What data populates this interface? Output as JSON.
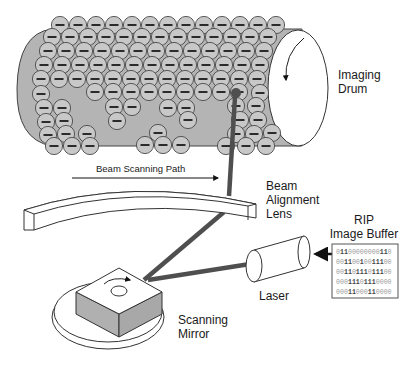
{
  "diagram": {
    "type": "laser-printer-imaging-process",
    "colors": {
      "drum_fill": "#b4b4b4",
      "toner_fill": "#c8c8c8",
      "toner_stroke": "#4a4a4a",
      "beam": "#4f4f4f",
      "outline": "#333333",
      "mirror_side": "#b0b0b0",
      "background": "#ffffff"
    },
    "labels": {
      "imaging_drum": [
        "Imaging",
        "Drum"
      ],
      "beam_scanning_path": "Beam Scanning Path",
      "beam_alignment_lens": [
        "Beam",
        "Alignment",
        "Lens"
      ],
      "rip_image_buffer": [
        "RIP",
        "Image Buffer"
      ],
      "laser": "Laser",
      "scanning_mirror": [
        "Scanning",
        "Mirror"
      ]
    },
    "toner_charge_symbol": "−",
    "rip_buffer_rows": [
      "01100000000110",
      "00110010011100",
      "00110111011100",
      "00011101110000",
      "00011000110000"
    ],
    "toner_particles": [
      [
        60,
        25
      ],
      [
        78,
        25
      ],
      [
        96,
        25
      ],
      [
        114,
        25
      ],
      [
        132,
        25
      ],
      [
        150,
        25
      ],
      [
        168,
        25
      ],
      [
        186,
        25
      ],
      [
        204,
        25
      ],
      [
        222,
        25
      ],
      [
        240,
        25
      ],
      [
        258,
        25
      ],
      [
        276,
        25
      ],
      [
        52,
        37
      ],
      [
        70,
        37
      ],
      [
        88,
        37
      ],
      [
        106,
        37
      ],
      [
        124,
        37
      ],
      [
        142,
        37
      ],
      [
        160,
        37
      ],
      [
        178,
        37
      ],
      [
        196,
        37
      ],
      [
        214,
        37
      ],
      [
        232,
        37
      ],
      [
        250,
        37
      ],
      [
        268,
        37
      ],
      [
        48,
        51
      ],
      [
        66,
        51
      ],
      [
        84,
        51
      ],
      [
        102,
        51
      ],
      [
        120,
        51
      ],
      [
        138,
        51
      ],
      [
        156,
        51
      ],
      [
        174,
        51
      ],
      [
        192,
        51
      ],
      [
        210,
        51
      ],
      [
        228,
        51
      ],
      [
        246,
        51
      ],
      [
        264,
        51
      ],
      [
        44,
        65
      ],
      [
        62,
        65
      ],
      [
        80,
        65
      ],
      [
        98,
        65
      ],
      [
        116,
        65
      ],
      [
        134,
        65
      ],
      [
        152,
        65
      ],
      [
        170,
        65
      ],
      [
        188,
        65
      ],
      [
        206,
        65
      ],
      [
        224,
        65
      ],
      [
        242,
        65
      ],
      [
        260,
        65
      ],
      [
        41,
        79
      ],
      [
        59,
        79
      ],
      [
        77,
        79
      ],
      [
        95,
        79
      ],
      [
        113,
        79
      ],
      [
        131,
        79
      ],
      [
        149,
        79
      ],
      [
        167,
        79
      ],
      [
        185,
        79
      ],
      [
        203,
        79
      ],
      [
        221,
        79
      ],
      [
        239,
        79
      ],
      [
        257,
        79
      ],
      [
        41,
        94
      ],
      [
        95,
        92
      ],
      [
        113,
        92
      ],
      [
        131,
        92
      ],
      [
        149,
        92
      ],
      [
        167,
        92
      ],
      [
        185,
        92
      ],
      [
        203,
        92
      ],
      [
        221,
        92
      ],
      [
        239,
        92
      ],
      [
        260,
        93
      ],
      [
        44,
        108
      ],
      [
        62,
        108
      ],
      [
        114,
        107
      ],
      [
        132,
        107
      ],
      [
        168,
        108
      ],
      [
        186,
        108
      ],
      [
        236,
        106
      ],
      [
        256,
        106
      ],
      [
        46,
        122
      ],
      [
        64,
        121
      ],
      [
        117,
        121
      ],
      [
        188,
        120
      ],
      [
        240,
        120
      ],
      [
        258,
        120
      ],
      [
        48,
        135
      ],
      [
        66,
        134
      ],
      [
        87,
        134
      ],
      [
        158,
        133
      ],
      [
        236,
        134
      ],
      [
        254,
        134
      ],
      [
        272,
        133
      ],
      [
        54,
        146
      ],
      [
        72,
        146
      ],
      [
        90,
        146
      ],
      [
        145,
        145
      ],
      [
        163,
        145
      ],
      [
        181,
        145
      ],
      [
        226,
        146
      ],
      [
        246,
        146
      ],
      [
        266,
        146
      ]
    ]
  }
}
